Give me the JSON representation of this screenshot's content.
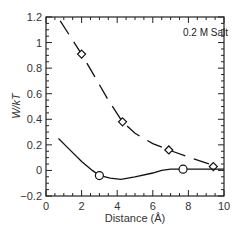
{
  "chart_data": {
    "type": "line",
    "title": "",
    "annotation": "0.2 M Salt",
    "xlabel": "Distance (Å)",
    "ylabel": "W/kT",
    "xlim": [
      0,
      10
    ],
    "ylim": [
      -0.2,
      1.2
    ],
    "x_ticks": [
      "0",
      "2",
      "4",
      "6",
      "8",
      "10"
    ],
    "y_ticks": [
      "1.2",
      "1",
      "0.8",
      "0.6",
      "0.4",
      "0.2",
      "0",
      "−0.2"
    ],
    "grid": false,
    "legend": null,
    "series": [
      {
        "name": "dashed curve (diamond markers)",
        "style": "dashed",
        "marker": "diamond",
        "curve": [
          [
            0.8,
            1.17
          ],
          [
            1.4,
            1.04
          ],
          [
            2.0,
            0.91
          ],
          [
            2.8,
            0.72
          ],
          [
            3.5,
            0.55
          ],
          [
            4.3,
            0.38
          ],
          [
            5.0,
            0.29
          ],
          [
            6.0,
            0.21
          ],
          [
            6.9,
            0.16
          ],
          [
            8.3,
            0.09
          ],
          [
            9.6,
            0.03
          ]
        ],
        "markers": [
          [
            2.0,
            0.91
          ],
          [
            4.3,
            0.38
          ],
          [
            6.9,
            0.16
          ],
          [
            9.4,
            0.03
          ]
        ]
      },
      {
        "name": "solid curve (circle markers)",
        "style": "solid",
        "marker": "circle",
        "curve": [
          [
            0.7,
            0.25
          ],
          [
            1.2,
            0.18
          ],
          [
            2.0,
            0.07
          ],
          [
            2.6,
            0.0
          ],
          [
            3.0,
            -0.04
          ],
          [
            3.6,
            -0.06
          ],
          [
            4.2,
            -0.07
          ],
          [
            5.0,
            -0.05
          ],
          [
            6.0,
            -0.02
          ],
          [
            6.5,
            0.0
          ],
          [
            7.0,
            0.01
          ],
          [
            7.7,
            0.01
          ],
          [
            9.0,
            0.01
          ],
          [
            10.0,
            0.01
          ]
        ],
        "markers": [
          [
            3.0,
            -0.04
          ],
          [
            7.7,
            0.01
          ]
        ]
      }
    ]
  }
}
